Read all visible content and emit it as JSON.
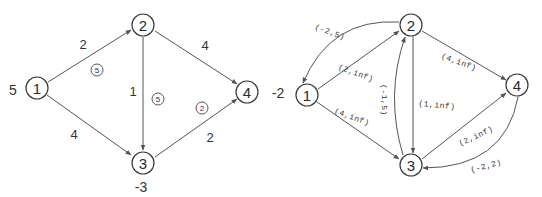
{
  "left_graph": {
    "nodes": [
      {
        "id": "1",
        "label": "1",
        "supply": "5"
      },
      {
        "id": "2",
        "label": "2",
        "supply": ""
      },
      {
        "id": "3",
        "label": "3",
        "supply": "-3"
      },
      {
        "id": "4",
        "label": "4",
        "supply": "-2"
      }
    ],
    "edges": [
      {
        "from": "1",
        "to": "2",
        "cost": "2",
        "flow": "5"
      },
      {
        "from": "1",
        "to": "3",
        "cost": "4",
        "flow": ""
      },
      {
        "from": "2",
        "to": "3",
        "cost": "1",
        "flow": "5"
      },
      {
        "from": "2",
        "to": "4",
        "cost": "4",
        "flow": ""
      },
      {
        "from": "3",
        "to": "4",
        "cost": "2",
        "flow": "2"
      }
    ]
  },
  "right_graph": {
    "nodes": [
      {
        "id": "1",
        "label": "1"
      },
      {
        "id": "2",
        "label": "2"
      },
      {
        "id": "3",
        "label": "3"
      },
      {
        "id": "4",
        "label": "4"
      }
    ],
    "supply_label": "-2",
    "edges": [
      {
        "from": "2",
        "to": "1",
        "label": "(-2,5)"
      },
      {
        "from": "1",
        "to": "2",
        "label": "(2,inf)"
      },
      {
        "from": "1",
        "to": "3",
        "label": "(4,inf)"
      },
      {
        "from": "3",
        "to": "2",
        "label": "(-1,5)"
      },
      {
        "from": "2",
        "to": "3",
        "label": "(1,inf)"
      },
      {
        "from": "2",
        "to": "4",
        "label": "(4,inf)"
      },
      {
        "from": "3",
        "to": "4",
        "label": "(2,inf)"
      },
      {
        "from": "4",
        "to": "3",
        "label": "(-2,2)"
      }
    ]
  }
}
